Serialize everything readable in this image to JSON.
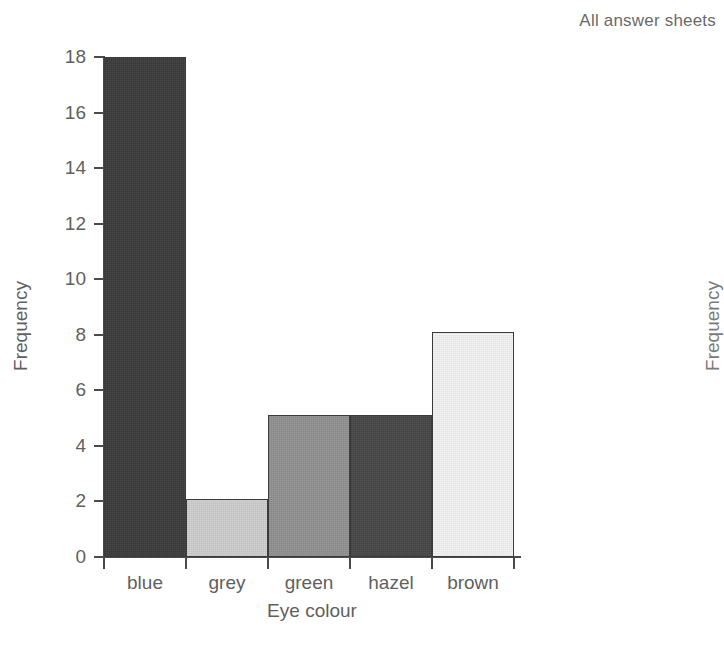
{
  "caption": "All answer sheets",
  "neighbour_chart": {
    "y_axis_title": "Frequency"
  },
  "chart_data": {
    "type": "bar",
    "title": "All answer sheets",
    "xlabel": "Eye colour",
    "ylabel": "Frequency",
    "categories": [
      "blue",
      "grey",
      "green",
      "hazel",
      "brown"
    ],
    "values": [
      18,
      2.1,
      5.1,
      5.1,
      8.1
    ],
    "bar_colors": [
      "#3b3b3b",
      "#cfcfcf",
      "#919191",
      "#464646",
      "#f4f4f4"
    ],
    "ylim": [
      0,
      18
    ],
    "yticks": [
      0,
      2,
      4,
      6,
      8,
      10,
      12,
      14,
      16,
      18
    ],
    "ytick_labels": [
      "0",
      "2",
      "4",
      "6",
      "8",
      "10",
      "12",
      "14",
      "16",
      "18"
    ],
    "grid": false,
    "legend": false,
    "bars_contiguous": true
  }
}
